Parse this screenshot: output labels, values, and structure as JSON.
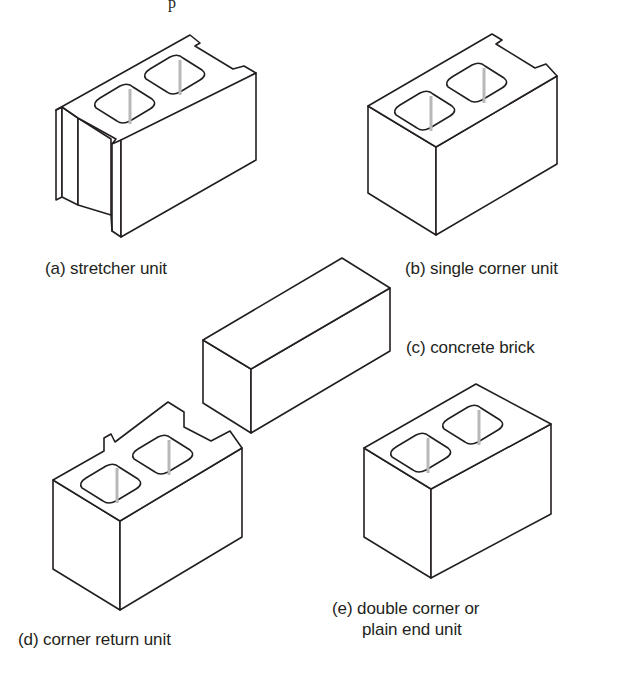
{
  "figure": {
    "top_fragment": "p",
    "units": [
      {
        "id": "a",
        "label": "(a) stretcher unit"
      },
      {
        "id": "b",
        "label": "(b) single corner unit"
      },
      {
        "id": "c",
        "label": "(c) concrete brick"
      },
      {
        "id": "d",
        "label": "(d) corner return unit"
      },
      {
        "id": "e",
        "label_line1": "(e) double corner or",
        "label_line2": "plain end unit"
      }
    ]
  },
  "colors": {
    "ink": "#231f20",
    "core_shade": "#b8b8b8",
    "background": "#ffffff"
  }
}
